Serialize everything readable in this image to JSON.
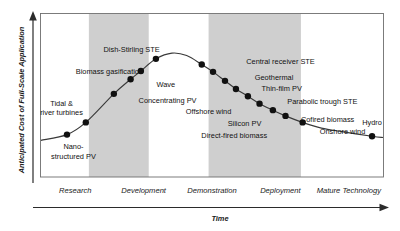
{
  "figure": {
    "title": "",
    "y_axis_label": "Anticipated Cost of Full-Scale Application",
    "x_axis_label": "Time"
  },
  "chart_data": {
    "type": "line",
    "title": "",
    "xlabel": "Time",
    "ylabel": "Anticipated Cost of Full-Scale Application",
    "xlim": [
      0,
      100
    ],
    "ylim": [
      0,
      100
    ],
    "grid": false,
    "legend": "none",
    "x_tick_labels": [
      "Research",
      "Development",
      "Demonstration",
      "Deployment",
      "Mature Technology"
    ],
    "y_tick_labels": [],
    "shaded_bands": [
      {
        "name": "Development",
        "x_start": 14,
        "x_end": 31.5,
        "color": "#cfcfcf"
      },
      {
        "name": "Deployment",
        "x_start": 49,
        "x_end": 76,
        "color": "#cfcfcf"
      }
    ],
    "series": [
      {
        "name": "Technology cost maturity curve",
        "x": [
          0,
          7.6,
          13.1,
          21.3,
          26.2,
          29.2,
          33.6,
          38.3,
          42.6,
          47.0,
          50.3,
          53.8,
          57.0,
          60.5,
          63.9,
          67.8,
          71.5,
          76.5,
          82.0,
          88.0,
          96.8,
          100
        ],
        "y": [
          22.5,
          26.0,
          33.5,
          51.0,
          60.0,
          65.0,
          72.5,
          76.0,
          74.5,
          69.0,
          64.5,
          59.0,
          54.0,
          49.5,
          45.0,
          41.0,
          37.5,
          33.5,
          30.0,
          27.8,
          25.0,
          24.2
        ]
      }
    ],
    "points": [
      {
        "label": "Nano-structured PV",
        "x": 7.6,
        "y": 26.0,
        "label_lines": [
          "Nano-",
          "structured PV"
        ],
        "label_x": 9.5,
        "label_y": 17.0,
        "label_anchor": "middle"
      },
      {
        "label": "Tidal & river turbines",
        "x": 13.1,
        "y": 33.5,
        "label_lines": [
          "Tidal &",
          "river turbines"
        ],
        "label_x": 6.0,
        "label_y": 43.5,
        "label_anchor": "middle"
      },
      {
        "label": "Biomass gasification",
        "x": 21.3,
        "y": 51.0,
        "label_lines": [
          "Biomass gasification"
        ],
        "label_x": 20.0,
        "label_y": 63.5,
        "label_anchor": "middle"
      },
      {
        "label": "Wave",
        "x": 26.2,
        "y": 60.0,
        "label_lines": [
          "Wave"
        ],
        "label_x": 36.5,
        "label_y": 55.0,
        "label_anchor": "middle"
      },
      {
        "label": "Dish-Stirling STE",
        "x": 29.2,
        "y": 65.0,
        "label_lines": [
          "Dish-Stirling STE"
        ],
        "label_x": 26.5,
        "label_y": 76.5,
        "label_anchor": "middle"
      },
      {
        "label": "Concentrating PV",
        "x": 33.6,
        "y": 72.5,
        "label_lines": [
          "Concentrating PV"
        ],
        "label_x": 37.0,
        "label_y": 45.5,
        "label_anchor": "middle"
      },
      {
        "label": "Central receiver STE",
        "x": 47.0,
        "y": 69.0,
        "label_lines": [
          "Central receiver STE"
        ],
        "label_x": 60.0,
        "label_y": 69.5,
        "label_anchor": "start"
      },
      {
        "label": "Offshore wind",
        "x": 50.3,
        "y": 64.5,
        "label_lines": [
          "Offshore wind"
        ],
        "label_x": 49.0,
        "label_y": 38.5,
        "label_anchor": "middle"
      },
      {
        "label": "Geothermal",
        "x": 53.8,
        "y": 59.0,
        "label_lines": [
          "Geothermal"
        ],
        "label_x": 62.5,
        "label_y": 59.5,
        "label_anchor": "start"
      },
      {
        "label": "Thin-film PV",
        "x": 57.0,
        "y": 54.0,
        "label_lines": [
          "Thin-film PV"
        ],
        "label_x": 64.5,
        "label_y": 52.5,
        "label_anchor": "start"
      },
      {
        "label": "Silicon PV",
        "x": 60.5,
        "y": 49.5,
        "label_lines": [
          "Silicon PV"
        ],
        "label_x": 59.5,
        "label_y": 31.5,
        "label_anchor": "middle"
      },
      {
        "label": "Direct-fired biomass",
        "x": 63.9,
        "y": 45.0,
        "label_lines": [
          "Direct-fired biomass"
        ],
        "label_x": 56.5,
        "label_y": 24.0,
        "label_anchor": "middle"
      },
      {
        "label": "Parabolic trough STE",
        "x": 67.8,
        "y": 41.0,
        "label_lines": [
          "Parabolic trough STE"
        ],
        "label_x": 72.0,
        "label_y": 44.5,
        "label_anchor": "start"
      },
      {
        "label": "Cofired biomass",
        "x": 71.5,
        "y": 37.5,
        "label_lines": [
          "Cofired biomass"
        ],
        "label_x": 76.0,
        "label_y": 34.0,
        "label_anchor": "start"
      },
      {
        "label": "Onshore wind",
        "x": 76.5,
        "y": 33.5,
        "label_lines": [
          "Onshore wind"
        ],
        "label_x": 81.5,
        "label_y": 26.5,
        "label_anchor": "start"
      },
      {
        "label": "Hydro",
        "x": 96.8,
        "y": 25.0,
        "label_lines": [
          "Hydro"
        ],
        "label_x": 96.8,
        "label_y": 32.0,
        "label_anchor": "middle"
      }
    ]
  },
  "colors": {
    "band": "#cfcfcf",
    "curve": "#3a3a3a",
    "dot": "#111111",
    "frame": "#6e6e6e",
    "text": "#111111",
    "background": "#ffffff"
  }
}
